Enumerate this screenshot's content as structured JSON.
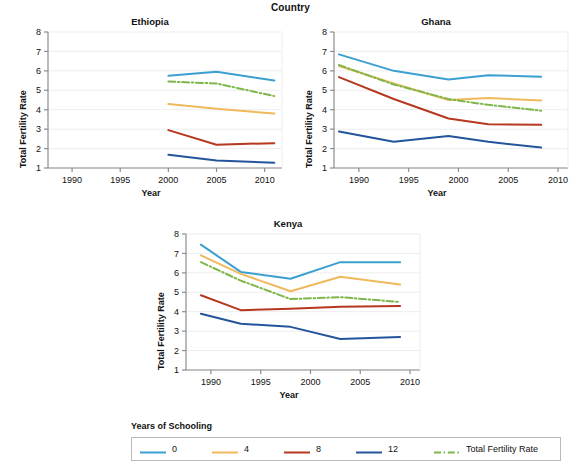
{
  "figure": {
    "title": "Country",
    "axis_labels": {
      "x": "Year",
      "y": "Total Fertility Rate"
    }
  },
  "legend": {
    "title": "Years of Schooling",
    "items": [
      {
        "label": "0",
        "color": "#3b9fd0",
        "style": "solid"
      },
      {
        "label": "4",
        "color": "#f0b95c",
        "style": "solid"
      },
      {
        "label": "8",
        "color": "#b5381f",
        "style": "solid"
      },
      {
        "label": "12",
        "color": "#24559c",
        "style": "solid"
      },
      {
        "label": "Total Fertility Rate",
        "color": "#7db74a",
        "style": "dashdot"
      }
    ]
  },
  "chart_data": [
    {
      "type": "line",
      "title": "Ethiopia",
      "xlabel": "Year",
      "ylabel": "Total Fertility Rate",
      "xlim": [
        1987.5,
        2011.8
      ],
      "ylim": [
        1,
        8
      ],
      "xticks": [
        1990,
        1995,
        2000,
        2005,
        2010
      ],
      "yticks": [
        1,
        2,
        3,
        4,
        5,
        6,
        7,
        8
      ],
      "grid": "horizontal",
      "x": [
        2000,
        2005,
        2011
      ],
      "series": [
        {
          "name": "0",
          "color": "#3b9fd0",
          "style": "solid",
          "values": [
            5.75,
            5.95,
            5.5
          ]
        },
        {
          "name": "4",
          "color": "#f0b95c",
          "style": "solid",
          "values": [
            4.3,
            4.05,
            3.8
          ]
        },
        {
          "name": "8",
          "color": "#b5381f",
          "style": "solid",
          "values": [
            2.95,
            2.2,
            2.28
          ]
        },
        {
          "name": "12",
          "color": "#24559c",
          "style": "solid",
          "values": [
            1.68,
            1.38,
            1.27
          ]
        },
        {
          "name": "Total Fertility Rate",
          "color": "#7db74a",
          "style": "dashdot",
          "values": [
            5.45,
            5.35,
            4.7
          ]
        }
      ]
    },
    {
      "type": "line",
      "title": "Ghana",
      "xlabel": "Year",
      "ylabel": "Total Fertility Rate",
      "xlim": [
        1987.5,
        2011.0
      ],
      "ylim": [
        1,
        8
      ],
      "xticks": [
        1990,
        1995,
        2000,
        2005,
        2010
      ],
      "yticks": [
        1,
        2,
        3,
        4,
        5,
        6,
        7,
        8
      ],
      "grid": "horizontal",
      "x": [
        1988,
        1993.5,
        1999,
        2003,
        2008.3
      ],
      "series": [
        {
          "name": "0",
          "color": "#3b9fd0",
          "style": "solid",
          "values": [
            6.85,
            6.0,
            5.55,
            5.78,
            5.7
          ]
        },
        {
          "name": "4",
          "color": "#f0b95c",
          "style": "solid",
          "values": [
            6.25,
            5.35,
            4.5,
            4.6,
            4.48
          ]
        },
        {
          "name": "8",
          "color": "#b5381f",
          "style": "solid",
          "values": [
            5.68,
            4.55,
            3.55,
            3.25,
            3.22
          ]
        },
        {
          "name": "12",
          "color": "#24559c",
          "style": "solid",
          "values": [
            2.88,
            2.35,
            2.65,
            2.35,
            2.05
          ]
        },
        {
          "name": "Total Fertility Rate",
          "color": "#7db74a",
          "style": "dashdot",
          "values": [
            6.3,
            5.3,
            4.55,
            4.25,
            3.95
          ]
        }
      ]
    },
    {
      "type": "line",
      "title": "Kenya",
      "xlabel": "Year",
      "ylabel": "Total Fertility Rate",
      "xlim": [
        1987.5,
        2011.0
      ],
      "ylim": [
        1,
        8
      ],
      "xticks": [
        1990,
        1995,
        2000,
        2005,
        2010
      ],
      "yticks": [
        1,
        2,
        3,
        4,
        5,
        6,
        7,
        8
      ],
      "grid": "horizontal",
      "x": [
        1989,
        1993,
        1998,
        2003,
        2009
      ],
      "series": [
        {
          "name": "0",
          "color": "#3b9fd0",
          "style": "solid",
          "values": [
            7.45,
            6.05,
            5.7,
            6.55,
            6.55
          ]
        },
        {
          "name": "4",
          "color": "#f0b95c",
          "style": "solid",
          "values": [
            6.9,
            5.95,
            5.05,
            5.8,
            5.4
          ]
        },
        {
          "name": "8",
          "color": "#b5381f",
          "style": "solid",
          "values": [
            4.85,
            4.08,
            4.15,
            4.25,
            4.3
          ]
        },
        {
          "name": "12",
          "color": "#24559c",
          "style": "solid",
          "values": [
            3.9,
            3.38,
            3.22,
            2.6,
            2.7
          ]
        },
        {
          "name": "Total Fertility Rate",
          "color": "#7db74a",
          "style": "dashdot",
          "values": [
            6.55,
            5.6,
            4.65,
            4.75,
            4.5
          ]
        }
      ]
    }
  ]
}
